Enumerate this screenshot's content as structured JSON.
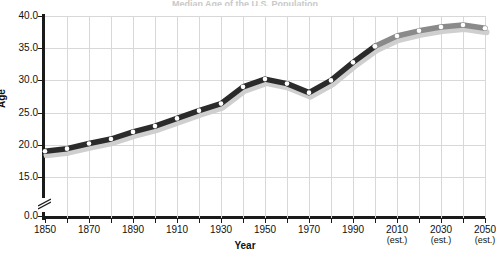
{
  "title_sliver": "Median Age of the U.S. Population",
  "axes": {
    "ylabel": "Age",
    "xlabel": "Year",
    "y_ticks": [
      "0.0",
      "15.0",
      "20.0",
      "25.0",
      "30.0",
      "35.0",
      "40.0"
    ],
    "x_ticks": [
      {
        "label": "1850",
        "est": ""
      },
      {
        "label": "1870",
        "est": ""
      },
      {
        "label": "1890",
        "est": ""
      },
      {
        "label": "1910",
        "est": ""
      },
      {
        "label": "1930",
        "est": ""
      },
      {
        "label": "1950",
        "est": ""
      },
      {
        "label": "1970",
        "est": ""
      },
      {
        "label": "1990",
        "est": ""
      },
      {
        "label": "2010",
        "est": "(est.)"
      },
      {
        "label": "2030",
        "est": "(est.)"
      },
      {
        "label": "2050",
        "est": "(est.)"
      }
    ]
  },
  "colors": {
    "historical_line": "#2b2b2b",
    "estimate_line": "#8a8a8a",
    "shadow": "#cfcfcf",
    "marker_fill": "#ffffff",
    "grid": "#d8d8d8",
    "axis": "#1a1a1a"
  },
  "chart_data": {
    "type": "line",
    "title": "Median Age of the U.S. Population",
    "xlabel": "Year",
    "ylabel": "Age",
    "xlim": [
      1850,
      2050
    ],
    "ylim": [
      15.0,
      40.0
    ],
    "y_axis_break": true,
    "y_break_below": 15.0,
    "grid": true,
    "legend": "none",
    "x": [
      1850,
      1860,
      1870,
      1880,
      1890,
      1900,
      1910,
      1920,
      1930,
      1940,
      1950,
      1960,
      1970,
      1980,
      1990,
      2000,
      2010,
      2020,
      2030,
      2040,
      2050
    ],
    "values": [
      19.0,
      19.4,
      20.2,
      20.9,
      22.0,
      22.9,
      24.1,
      25.3,
      26.4,
      29.0,
      30.2,
      29.5,
      28.1,
      30.0,
      32.8,
      35.3,
      36.9,
      37.7,
      38.3,
      38.6,
      38.1
    ],
    "series": [
      {
        "name": "Median age (historical)",
        "segment": "1850-2000 observed",
        "style": "dark-line-with-white-markers",
        "x": [
          1850,
          1860,
          1870,
          1880,
          1890,
          1900,
          1910,
          1920,
          1930,
          1940,
          1950,
          1960,
          1970,
          1980,
          1990,
          2000
        ],
        "values": [
          19.0,
          19.4,
          20.2,
          20.9,
          22.0,
          22.9,
          24.1,
          25.3,
          26.4,
          29.0,
          30.2,
          29.5,
          28.1,
          30.0,
          32.8,
          35.3
        ]
      },
      {
        "name": "Median age (projected)",
        "segment": "2000-2050 estimated",
        "style": "gray-line-with-white-markers",
        "x": [
          2000,
          2010,
          2020,
          2030,
          2040,
          2050
        ],
        "values": [
          35.3,
          36.9,
          37.7,
          38.3,
          38.6,
          38.1
        ]
      }
    ],
    "annotations": [
      {
        "text": "(est.)",
        "at_x": 2010
      },
      {
        "text": "(est.)",
        "at_x": 2030
      },
      {
        "text": "(est.)",
        "at_x": 2050
      }
    ]
  }
}
